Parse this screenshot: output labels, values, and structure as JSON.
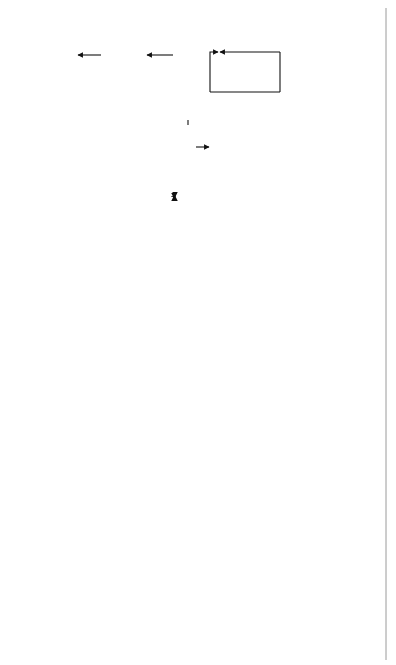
{
  "diagram": {
    "orientation": "rotated-90-ccw",
    "nodes": {
      "implementation": {
        "line1": "Implementation",
        "line2": "of strategies"
      },
      "short_range": {
        "line1": "Short- (3-5 year)",
        "line2": "range program"
      },
      "long_range": {
        "line1": "Long-",
        "line2": "range",
        "line3": "plan"
      },
      "evaluation": {
        "line1": "Evaluation"
      },
      "other_sources": {
        "line1": "Other sources",
        "line2": "for project",
        "line3": "ideas"
      },
      "alternative": {
        "line1": "Alternative",
        "line2": "improvement",
        "line3": "strategies"
      },
      "analysis": {
        "line1": "Analysis",
        "line2": "methods"
      },
      "system_ops": {
        "line1": "System",
        "line2": "operations"
      },
      "performance": {
        "line1": "Performance",
        "line2": "measures"
      },
      "data": {
        "line1": "Data"
      },
      "goals": {
        "line1": "Goals and",
        "line2": "objectives"
      }
    },
    "strategy_box": {
      "items": [
        "Policies",
        "Operations strategies",
        "Infrastructure projects",
        "Studies",
        "Regulations",
        "Education and awareness",
        "Enforcement",
        "Financing strategies",
        "Partnerships",
        "Collaborative undertakings"
      ]
    },
    "vision": {
      "center": "Vision",
      "economic": {
        "line1": "Economic",
        "line2": "development"
      },
      "environmental": {
        "line1": "Environmental",
        "line2": "quality"
      },
      "mobility": {
        "line1": "Mobility and",
        "line2": "accessibility"
      }
    },
    "cloud": {
      "line1": "Understanding",
      "line2": "the problem"
    },
    "colors": {
      "stroke": "#111111",
      "cloud_fill": "#8a8a8a",
      "cloud_shadow": "#a9a9a9",
      "gray_arrow": "#a8a8a8",
      "vision_arrow": "#777777"
    }
  }
}
